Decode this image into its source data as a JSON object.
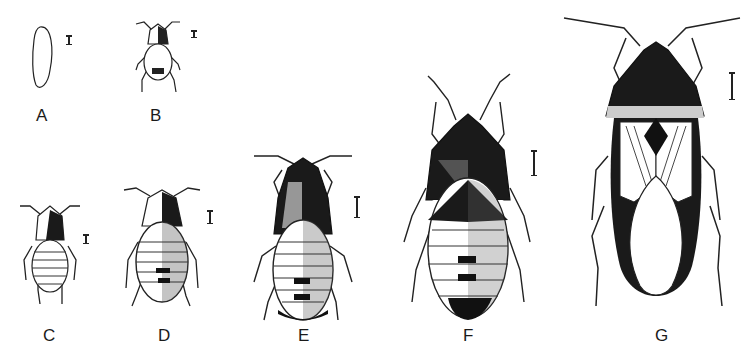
{
  "figure": {
    "background": "#ffffff",
    "ink_color": "#1a1a1a",
    "stages": [
      {
        "id": "A",
        "label": "A",
        "description": "egg"
      },
      {
        "id": "B",
        "label": "B",
        "description": "first instar nymph"
      },
      {
        "id": "C",
        "label": "C",
        "description": "second instar nymph"
      },
      {
        "id": "D",
        "label": "D",
        "description": "third instar nymph"
      },
      {
        "id": "E",
        "label": "E",
        "description": "fourth instar nymph"
      },
      {
        "id": "F",
        "label": "F",
        "description": "fifth instar nymph"
      },
      {
        "id": "G",
        "label": "G",
        "description": "adult"
      }
    ]
  }
}
